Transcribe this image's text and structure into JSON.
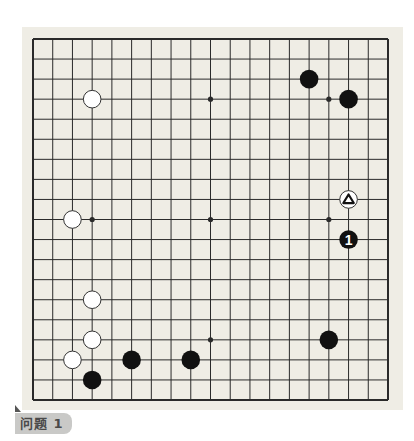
{
  "board": {
    "size": 19,
    "colors": {
      "background": "#efede5",
      "line": "#2a2a2a",
      "black_stone": "#111111",
      "white_stone": "#ffffff",
      "white_outline": "#333333"
    },
    "star_points": [
      [
        3,
        3
      ],
      [
        9,
        3
      ],
      [
        15,
        3
      ],
      [
        3,
        9
      ],
      [
        9,
        9
      ],
      [
        15,
        9
      ],
      [
        3,
        15
      ],
      [
        9,
        15
      ],
      [
        15,
        15
      ]
    ],
    "stones": [
      {
        "color": "white",
        "col": 3,
        "row": 3
      },
      {
        "color": "black",
        "col": 14,
        "row": 2
      },
      {
        "color": "black",
        "col": 16,
        "row": 3
      },
      {
        "color": "white",
        "col": 16,
        "row": 8,
        "mark": "triangle"
      },
      {
        "color": "black",
        "col": 16,
        "row": 10,
        "label": "1"
      },
      {
        "color": "white",
        "col": 2,
        "row": 9
      },
      {
        "color": "white",
        "col": 3,
        "row": 13
      },
      {
        "color": "white",
        "col": 3,
        "row": 15
      },
      {
        "color": "white",
        "col": 2,
        "row": 16
      },
      {
        "color": "black",
        "col": 3,
        "row": 17
      },
      {
        "color": "black",
        "col": 5,
        "row": 16
      },
      {
        "color": "black",
        "col": 8,
        "row": 16
      },
      {
        "color": "black",
        "col": 15,
        "row": 15
      }
    ]
  },
  "problem": {
    "label": "问题 1"
  }
}
